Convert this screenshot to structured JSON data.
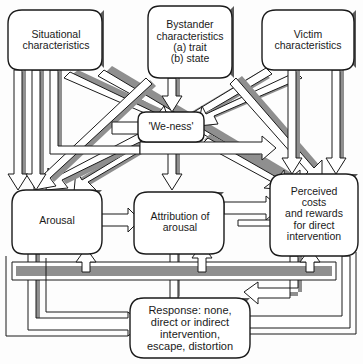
{
  "diagram": {
    "style": {
      "box_fill": "#ffffff",
      "box_stroke": "#1a1a1a",
      "arrow_fill": "#ffffff",
      "arrow_stroke": "#1a1a1a",
      "arrow_shadow": "#8a8a8a",
      "arrow_shadow_dark": "#6f6f6f",
      "text_color": "#1a1a1a",
      "page_background": "#fdfdfd"
    },
    "nodes": [
      {
        "id": "situational",
        "label": "Situational\ncharacteristics",
        "row": "top",
        "column": "left"
      },
      {
        "id": "bystander",
        "label": "Bystander\ncharacteristics\n(a) trait\n(b) state",
        "row": "top",
        "column": "center"
      },
      {
        "id": "victim",
        "label": "Victim\ncharacteristics",
        "row": "top",
        "column": "right"
      },
      {
        "id": "weness",
        "label": "'We-ness'",
        "row": "middle",
        "column": "center"
      },
      {
        "id": "arousal",
        "label": "Arousal",
        "row": "lower",
        "column": "left"
      },
      {
        "id": "attribution",
        "label": "Attribution of\narousal",
        "row": "lower",
        "column": "center"
      },
      {
        "id": "perceived",
        "label": "Perceived\ncosts\nand rewards\nfor direct\nintervention",
        "row": "lower",
        "column": "right"
      },
      {
        "id": "response",
        "label": "Response: none,\ndirect or indirect\nintervention,\nescape, distortion",
        "row": "bottom",
        "column": "center"
      }
    ],
    "edges": [
      {
        "from": "situational",
        "to": "arousal"
      },
      {
        "from": "situational",
        "to": "attribution"
      },
      {
        "from": "situational",
        "to": "weness"
      },
      {
        "from": "situational",
        "to": "perceived"
      },
      {
        "from": "bystander",
        "to": "weness"
      },
      {
        "from": "bystander",
        "to": "arousal"
      },
      {
        "from": "bystander",
        "to": "attribution"
      },
      {
        "from": "bystander",
        "to": "perceived"
      },
      {
        "from": "victim",
        "to": "weness"
      },
      {
        "from": "victim",
        "to": "arousal"
      },
      {
        "from": "victim",
        "to": "perceived"
      },
      {
        "from": "weness",
        "to": "arousal"
      },
      {
        "from": "weness",
        "to": "attribution"
      },
      {
        "from": "weness",
        "to": "perceived"
      },
      {
        "from": "arousal",
        "to": "response"
      },
      {
        "from": "attribution",
        "to": "response"
      },
      {
        "from": "perceived",
        "to": "response"
      },
      {
        "from": "attribution",
        "to": "perceived"
      },
      {
        "from": "response",
        "to": "arousal"
      },
      {
        "from": "response",
        "to": "attribution"
      },
      {
        "from": "response",
        "to": "perceived"
      }
    ]
  },
  "labels": {
    "situational": "Situational\ncharacteristics",
    "bystander": "Bystander\ncharacteristics\n(a) trait\n(b) state",
    "victim": "Victim\ncharacteristics",
    "weness": "'We-ness'",
    "arousal": "Arousal",
    "attribution": "Attribution of\narousal",
    "perceived": "Perceived\ncosts\nand rewards\nfor direct\nintervention",
    "response": "Response: none,\ndirect or indirect\nintervention,\nescape, distortion"
  }
}
